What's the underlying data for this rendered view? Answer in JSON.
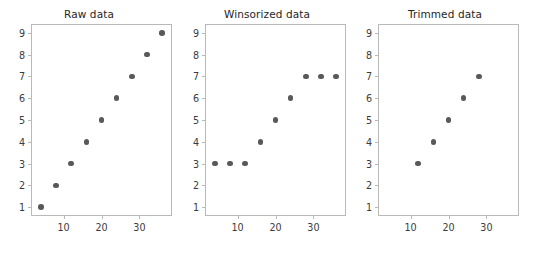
{
  "figure": {
    "background": "#ffffff",
    "width": 534,
    "height": 255,
    "marker_color": "#595959",
    "axis_color": "#b9b9b9",
    "text_color": "#3b3b3b"
  },
  "chart_data": [
    {
      "type": "scatter",
      "title": "Raw data",
      "xlabel": "",
      "ylabel": "",
      "x": [
        4,
        8,
        12,
        16,
        20,
        24,
        28,
        32,
        36
      ],
      "values": [
        1,
        2,
        3,
        4,
        5,
        6,
        7,
        8,
        9
      ],
      "xlim": [
        1.4,
        38.6
      ],
      "ylim": [
        0.6,
        9.4
      ],
      "xticks": [
        10,
        20,
        30
      ],
      "xtick_labels": [
        "10",
        "20",
        "30"
      ],
      "yticks": [
        1,
        2,
        3,
        4,
        5,
        6,
        7,
        8,
        9
      ],
      "ytick_labels": [
        "1",
        "2",
        "3",
        "4",
        "5",
        "6",
        "7",
        "8",
        "9"
      ],
      "grid": false,
      "legend": "none"
    },
    {
      "type": "scatter",
      "title": "Winsorized data",
      "xlabel": "",
      "ylabel": "",
      "x": [
        4,
        8,
        12,
        16,
        20,
        24,
        28,
        32,
        36
      ],
      "values": [
        3,
        3,
        3,
        4,
        5,
        6,
        7,
        7,
        7
      ],
      "xlim": [
        1.4,
        38.6
      ],
      "ylim": [
        0.6,
        9.4
      ],
      "xticks": [
        10,
        20,
        30
      ],
      "xtick_labels": [
        "10",
        "20",
        "30"
      ],
      "yticks": [
        1,
        2,
        3,
        4,
        5,
        6,
        7,
        8,
        9
      ],
      "ytick_labels": [
        "1",
        "2",
        "3",
        "4",
        "5",
        "6",
        "7",
        "8",
        "9"
      ],
      "grid": false,
      "legend": "none"
    },
    {
      "type": "scatter",
      "title": "Trimmed data",
      "xlabel": "",
      "ylabel": "",
      "x": [
        12,
        16,
        20,
        24,
        28
      ],
      "values": [
        3,
        4,
        5,
        6,
        7
      ],
      "xlim": [
        1.4,
        38.6
      ],
      "ylim": [
        0.6,
        9.4
      ],
      "xticks": [
        10,
        20,
        30
      ],
      "xtick_labels": [
        "10",
        "20",
        "30"
      ],
      "yticks": [
        1,
        2,
        3,
        4,
        5,
        6,
        7,
        8,
        9
      ],
      "ytick_labels": [
        "1",
        "2",
        "3",
        "4",
        "5",
        "6",
        "7",
        "8",
        "9"
      ],
      "grid": false,
      "legend": "none"
    }
  ]
}
